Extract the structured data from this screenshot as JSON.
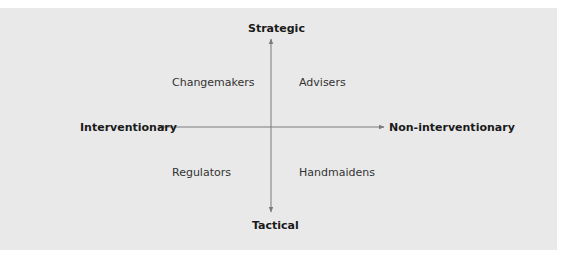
{
  "diagram": {
    "type": "quadrant",
    "axes": {
      "top": "Strategic",
      "bottom": "Tactical",
      "left": "Interventionary",
      "right": "Non-interventionary"
    },
    "quadrants": {
      "top_left": "Changemakers",
      "top_right": "Advisers",
      "bottom_left": "Regulators",
      "bottom_right": "Handmaidens"
    },
    "colors": {
      "background": "#e9e9e9",
      "axis_line": "#7a7a7a",
      "text": "#222222"
    }
  }
}
